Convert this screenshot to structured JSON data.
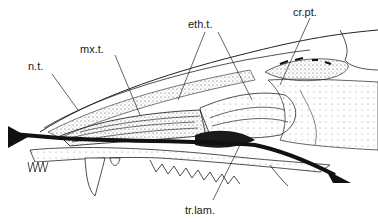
{
  "figure": {
    "type": "anatomical-illustration",
    "labels": [
      {
        "id": "n_t",
        "text": "n.t.",
        "x": 28,
        "y": 60
      },
      {
        "id": "mx_t",
        "text": "mx.t.",
        "x": 80,
        "y": 43
      },
      {
        "id": "eth_t",
        "text": "eth.t.",
        "x": 188,
        "y": 18
      },
      {
        "id": "cr_pt",
        "text": "cr.pt.",
        "x": 293,
        "y": 6
      },
      {
        "id": "tr_lam",
        "text": "tr.lam.",
        "x": 185,
        "y": 204
      }
    ],
    "arrow": {
      "description": "airflow path through nasal cavity",
      "color": "#111111"
    }
  }
}
